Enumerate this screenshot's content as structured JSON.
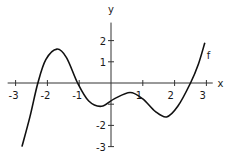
{
  "chart_data": {
    "type": "line",
    "title": "",
    "xlabel": "x",
    "ylabel": "y",
    "xlim": [
      -3.2,
      3.3
    ],
    "ylim": [
      -3,
      2.9
    ],
    "grid": false,
    "x_ticks": [
      -3,
      -2,
      -1,
      1,
      2,
      3
    ],
    "x_tick_labels": [
      "-3",
      "-2",
      "-1",
      "1",
      "2",
      "3"
    ],
    "y_ticks": [
      2,
      1,
      -2,
      -3
    ],
    "y_tick_labels": [
      "2",
      "1",
      "-2",
      "-3"
    ],
    "y_minor_ticks": [
      -1
    ],
    "series": [
      {
        "name": "f",
        "label": "f",
        "points": [
          [
            -2.8,
            -3.0
          ],
          [
            -2.55,
            -1.6
          ],
          [
            -2.3,
            0.0
          ],
          [
            -2.05,
            1.1
          ],
          [
            -1.7,
            1.6
          ],
          [
            -1.4,
            1.2
          ],
          [
            -1.05,
            0.0
          ],
          [
            -0.7,
            -0.85
          ],
          [
            -0.3,
            -1.1
          ],
          [
            0.1,
            -0.75
          ],
          [
            0.6,
            -0.45
          ],
          [
            1.0,
            -0.75
          ],
          [
            1.4,
            -1.35
          ],
          [
            1.75,
            -1.6
          ],
          [
            2.1,
            -1.1
          ],
          [
            2.5,
            0.0
          ],
          [
            2.75,
            0.9
          ],
          [
            2.95,
            1.9
          ]
        ]
      }
    ]
  }
}
